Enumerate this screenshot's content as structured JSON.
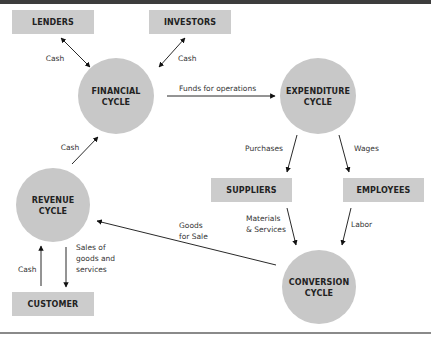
{
  "colors": {
    "box_fill": "#cccccc",
    "circle_fill": "#c8c8c8",
    "text": "#222222",
    "arrow": "#111111",
    "topbar": "#3d3d3d"
  },
  "boxes": {
    "lenders": "LENDERS",
    "investors": "INVESTORS",
    "suppliers": "SUPPLIERS",
    "employees": "EMPLOYEES",
    "customer": "CUSTOMER"
  },
  "cycles": {
    "financial": [
      "FINANCIAL",
      "CYCLE"
    ],
    "expenditure": [
      "EXPENDITURE",
      "CYCLE"
    ],
    "revenue": [
      "REVENUE",
      "CYCLE"
    ],
    "conversion": [
      "CONVERSION",
      "CYCLE"
    ]
  },
  "flows": {
    "lenders_cash": "Cash",
    "investors_cash": "Cash",
    "funds_for_operations": "Funds for operations",
    "revenue_cash": "Cash",
    "purchases": "Purchases",
    "wages": "Wages",
    "materials": [
      "Materials",
      "& Services"
    ],
    "labor": "Labor",
    "goods_for_sale": [
      "Goods",
      "for Sale"
    ],
    "customer_cash": "Cash",
    "sales": [
      "Sales of",
      "goods and",
      "services"
    ]
  }
}
